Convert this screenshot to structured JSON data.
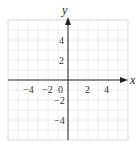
{
  "chart_data": {
    "type": "line",
    "title": "",
    "xlabel": "x",
    "ylabel": "y",
    "xlim": [
      -6,
      6
    ],
    "ylim": [
      -6,
      6
    ],
    "grid": true,
    "grid_step": 1,
    "x_ticks": [
      -4,
      -2,
      0,
      2,
      4
    ],
    "y_ticks": [
      4,
      2,
      -2,
      -4
    ],
    "x_tick_labels": [
      "−4",
      "−2",
      "0",
      "2",
      "4"
    ],
    "y_tick_labels": [
      "4",
      "2",
      "−2",
      "−4"
    ],
    "series": []
  },
  "labels": {
    "x_axis": "x",
    "y_axis": "y",
    "origin": "0",
    "xt_m4": "−4",
    "xt_m2": "−2",
    "xt_2": "2",
    "xt_4": "4",
    "yt_4": "4",
    "yt_2": "2",
    "yt_m2": "−2",
    "yt_m4": "−4"
  },
  "colors": {
    "grid": "#c8c8c8",
    "axis": "#222222"
  }
}
